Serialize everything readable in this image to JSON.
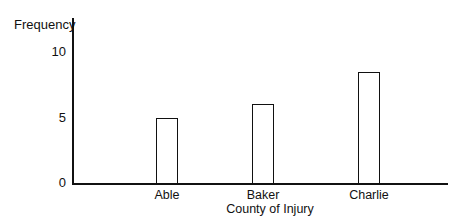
{
  "chart_data": {
    "type": "bar",
    "title": "",
    "xlabel": "County of Injury",
    "ylabel": "Frequency",
    "categories": [
      "Able",
      "Baker",
      "Charlie"
    ],
    "values": [
      5,
      6,
      8.5
    ],
    "ylim": [
      0,
      12
    ],
    "yticks": [
      "0",
      "5",
      "10"
    ],
    "grid": false,
    "legend": null
  },
  "labels": {
    "ylabel": "Frequency",
    "xlabel": "County of Injury",
    "tick_0": "0",
    "tick_5": "5",
    "tick_10": "10",
    "cat_0": "Able",
    "cat_1": "Baker",
    "cat_2": "Charlie"
  }
}
